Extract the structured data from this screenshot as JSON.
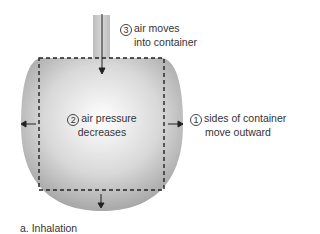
{
  "diagram": {
    "caption": "a. Inhalation",
    "labels": {
      "step1": {
        "number": "1",
        "line1": "sides of container",
        "line2": "move outward"
      },
      "step2": {
        "number": "2",
        "line1": "air pressure",
        "line2": "decreases"
      },
      "step3": {
        "number": "3",
        "line1": "air moves",
        "line2": "into container"
      }
    },
    "colors": {
      "container_edge": "#a9a9a9",
      "container_center": "#ffffff",
      "dash": "#222222"
    }
  }
}
